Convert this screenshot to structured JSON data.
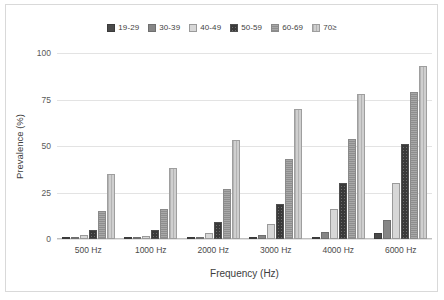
{
  "chart_data": {
    "type": "bar",
    "title": "",
    "subtitle": "",
    "xlabel": "Frequency (Hz)",
    "ylabel": "Prevalence (%)",
    "categories": [
      "500 Hz",
      "1000 Hz",
      "2000 Hz",
      "3000 Hz",
      "4000 Hz",
      "6000 Hz"
    ],
    "ylim": [
      0,
      100
    ],
    "yticks": [
      0,
      25,
      50,
      75,
      100
    ],
    "ytick_labels": [
      "0",
      "25",
      "50",
      "75",
      "100"
    ],
    "grid": true,
    "legend_position": "top-center",
    "series": [
      {
        "name": "19-29",
        "color": "#4a4a4a",
        "values": [
          1,
          0.5,
          0.5,
          1,
          1,
          3
        ]
      },
      {
        "name": "30-39",
        "color": "#868686",
        "values": [
          0.5,
          1,
          0.5,
          2,
          4,
          10
        ]
      },
      {
        "name": "40-49",
        "color": "#d7d7d7",
        "values": [
          2,
          1.5,
          3,
          8,
          16,
          30
        ]
      },
      {
        "name": "50-59",
        "color": "#6e6e6e",
        "values": [
          5,
          5,
          9,
          19,
          30,
          51
        ]
      },
      {
        "name": "60-69",
        "color": "#a8a8a8",
        "values": [
          15,
          16,
          27,
          43,
          54,
          79
        ]
      },
      {
        "name": "70≥",
        "color": "#cfcfcf",
        "values": [
          35,
          38,
          53,
          70,
          78,
          93
        ]
      }
    ]
  }
}
